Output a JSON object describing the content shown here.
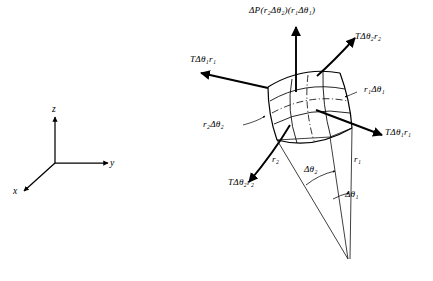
{
  "figure": {
    "background_color": "#ffffff",
    "line_color": "#000000",
    "width": 433,
    "height": 281
  },
  "axes": {
    "name": "cartesian-coordinate-triad",
    "origin": {
      "x": 55,
      "y": 163
    },
    "labels": {
      "x": "x",
      "y": "y",
      "z": "z"
    }
  },
  "labels": {
    "pressure_force": "ΔP(r₂Δθ₂)(r₁Δθ₁)",
    "tension_theta2_upper_right": "TΔθ₂r₂",
    "tension_theta1_upper_left": "TΔθ₁r₁",
    "tension_theta1_lower_right": "TΔθ₁r₁",
    "tension_theta2_lower_left": "TΔθ₂r₂",
    "arc_length_1": "r₁Δθ₁",
    "arc_length_2": "r₂Δθ₂",
    "radius_1": "r₁",
    "radius_2": "r₂",
    "angle_1": "Δθ₁",
    "angle_2": "Δθ₂"
  },
  "geometry": {
    "patch_corners": {
      "top_left": {
        "x": 268,
        "y": 87
      },
      "top_right": {
        "x": 340,
        "y": 73
      },
      "bottom_right": {
        "x": 352,
        "y": 128
      },
      "bottom_left": {
        "x": 277,
        "y": 140
      }
    },
    "apex": {
      "x": 348,
      "y": 259
    },
    "pressure_arrow": {
      "from_x": 296,
      "from_y": 92,
      "to_x": 296,
      "to_y": 27
    }
  }
}
